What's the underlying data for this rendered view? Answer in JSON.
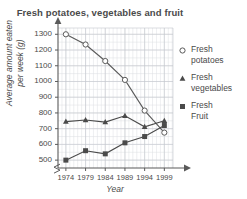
{
  "chart_data": {
    "type": "line",
    "title": "Fresh potatoes, vegetables and fruit",
    "xlabel": "Year",
    "ylabel_line1": "Average amount eaten",
    "ylabel_line2": "per week (g)",
    "categories": [
      "1974",
      "1979",
      "1984",
      "1989",
      "1994",
      "1999"
    ],
    "x": [
      1974,
      1979,
      1984,
      1989,
      1994,
      1999
    ],
    "ylim": [
      450,
      1340
    ],
    "yticks": [
      500,
      600,
      700,
      800,
      900,
      1000,
      1100,
      1200,
      1300
    ],
    "grid": true,
    "y_axis_break": true,
    "legend_position": "right",
    "series": [
      {
        "name": "Fresh potatoes",
        "legend_label_line1": "Fresh",
        "legend_label_line2": "potatoes",
        "marker": "open-circle",
        "color": "#5a5a5a",
        "values": [
          1300,
          1235,
          1130,
          1010,
          815,
          675
        ]
      },
      {
        "name": "Fresh vegetables",
        "legend_label_line1": "Fresh",
        "legend_label_line2": "vegetables",
        "marker": "filled-triangle",
        "color": "#4a4a4a",
        "values": [
          745,
          755,
          742,
          782,
          712,
          750
        ]
      },
      {
        "name": "Fresh Fruit",
        "legend_label_line1": "Fresh",
        "legend_label_line2": "Fruit",
        "marker": "filled-square",
        "color": "#4a4a4a",
        "values": [
          500,
          560,
          540,
          610,
          650,
          720
        ]
      }
    ]
  }
}
